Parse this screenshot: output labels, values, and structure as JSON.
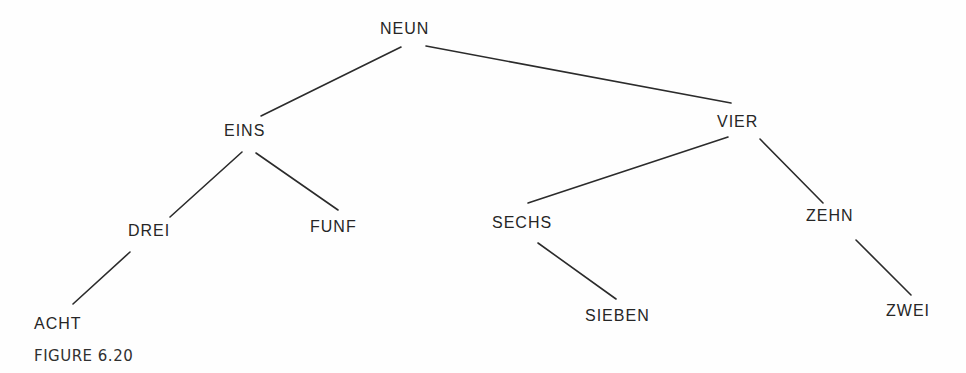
{
  "figure": {
    "caption": "FIGURE 6.20",
    "type": "binary-tree"
  },
  "nodes": {
    "neun": {
      "label": "NEUN",
      "x": 380,
      "y": 20
    },
    "eins": {
      "label": "EINS",
      "x": 224,
      "y": 122
    },
    "vier": {
      "label": "VIER",
      "x": 717,
      "y": 113
    },
    "drei": {
      "label": "DREI",
      "x": 128,
      "y": 222
    },
    "funf": {
      "label": "FUNF",
      "x": 310,
      "y": 218
    },
    "sechs": {
      "label": "SECHS",
      "x": 492,
      "y": 214
    },
    "zehn": {
      "label": "ZEHN",
      "x": 806,
      "y": 207
    },
    "acht": {
      "label": "ACHT",
      "x": 34,
      "y": 315
    },
    "sieben": {
      "label": "SIEBEN",
      "x": 585,
      "y": 307
    },
    "zwei": {
      "label": "ZWEI",
      "x": 886,
      "y": 302
    }
  },
  "edges": [
    {
      "from": "NEUN",
      "to": "EINS",
      "x1": 401,
      "y1": 47,
      "x2": 261,
      "y2": 116
    },
    {
      "from": "NEUN",
      "to": "VIER",
      "x1": 426,
      "y1": 46,
      "x2": 731,
      "y2": 103
    },
    {
      "from": "EINS",
      "to": "DREI",
      "x1": 242,
      "y1": 152,
      "x2": 170,
      "y2": 217
    },
    {
      "from": "EINS",
      "to": "FUNF",
      "x1": 256,
      "y1": 153,
      "x2": 338,
      "y2": 210
    },
    {
      "from": "DREI",
      "to": "ACHT",
      "x1": 130,
      "y1": 252,
      "x2": 73,
      "y2": 304
    },
    {
      "from": "VIER",
      "to": "SECHS",
      "x1": 728,
      "y1": 137,
      "x2": 528,
      "y2": 203
    },
    {
      "from": "VIER",
      "to": "ZEHN",
      "x1": 760,
      "y1": 139,
      "x2": 823,
      "y2": 203
    },
    {
      "from": "SECHS",
      "to": "SIEBEN",
      "x1": 538,
      "y1": 243,
      "x2": 616,
      "y2": 299
    },
    {
      "from": "ZEHN",
      "to": "ZWEI",
      "x1": 856,
      "y1": 240,
      "x2": 911,
      "y2": 295
    }
  ],
  "colors": {
    "ink": "#262626",
    "background": "#fefefe"
  }
}
